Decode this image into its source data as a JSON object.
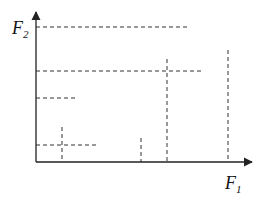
{
  "diagram": {
    "y_axis_label": {
      "main": "F",
      "sub": "2"
    },
    "x_axis_label": {
      "main": "F",
      "sub": "1"
    },
    "colors": {
      "axis": "#222222",
      "dash": "#333333",
      "background": "#ffffff"
    },
    "axes": {
      "origin": [
        36,
        162
      ],
      "x_end": [
        252,
        162
      ],
      "y_end": [
        36,
        12
      ]
    },
    "horizontal_dashed_lines": [
      {
        "y": 27,
        "x1": 36,
        "x2": 190
      },
      {
        "y": 71,
        "x1": 36,
        "x2": 202
      },
      {
        "y": 98,
        "x1": 36,
        "x2": 77
      },
      {
        "y": 145,
        "x1": 36,
        "x2": 99
      }
    ],
    "vertical_dashed_lines": [
      {
        "x": 62,
        "y1": 127,
        "y2": 162
      },
      {
        "x": 141,
        "y1": 138,
        "y2": 162
      },
      {
        "x": 167,
        "y1": 59,
        "y2": 162
      },
      {
        "x": 228,
        "y1": 50,
        "y2": 162
      }
    ]
  }
}
